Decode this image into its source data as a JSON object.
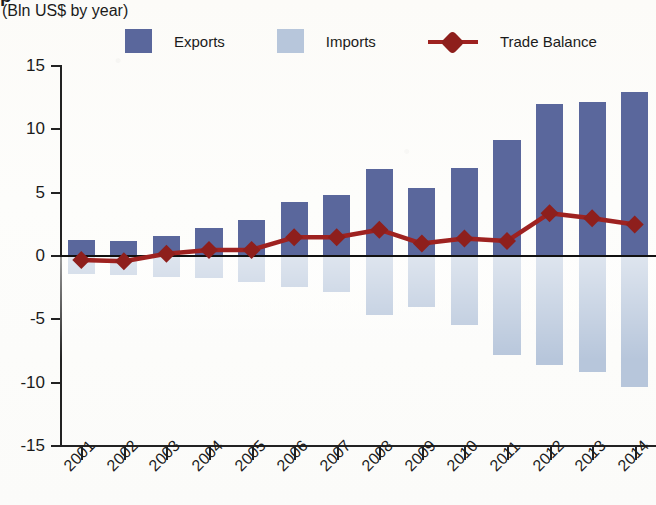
{
  "title_partial": "p",
  "subtitle": "(Bln US$ by year)",
  "legend": {
    "exports": {
      "label": "Exports",
      "color": "#5a679c"
    },
    "imports": {
      "label": "Imports",
      "color": "#b7c6db"
    },
    "balance": {
      "label": "Trade Balance",
      "color": "#9e2220"
    }
  },
  "axes": {
    "y_ticks": [
      "15",
      "10",
      "5",
      "0",
      "-5",
      "-10",
      "-15"
    ],
    "y_values": [
      15,
      10,
      5,
      0,
      -5,
      -10,
      -15
    ],
    "x_ticks": [
      "2001",
      "2002",
      "2003",
      "2004",
      "2005",
      "2006",
      "2007",
      "2008",
      "2009",
      "2010",
      "2011",
      "2012",
      "2013",
      "2014"
    ]
  },
  "chart_data": {
    "type": "bar",
    "title": "(Bln US$ by year)",
    "xlabel": "",
    "ylabel": "Bln US$",
    "ylim": [
      -15,
      15
    ],
    "grid": false,
    "legend_position": "top",
    "categories": [
      "2001",
      "2002",
      "2003",
      "2004",
      "2005",
      "2006",
      "2007",
      "2008",
      "2009",
      "2010",
      "2011",
      "2012",
      "2013",
      "2014"
    ],
    "series": [
      {
        "name": "Exports",
        "type": "bar",
        "color": "#5a679c",
        "values": [
          1.2,
          1.1,
          1.5,
          2.1,
          2.8,
          4.2,
          4.7,
          6.8,
          5.3,
          6.9,
          9.1,
          11.9,
          12.1,
          12.9
        ]
      },
      {
        "name": "Imports",
        "type": "bar",
        "color": "#b7c6db",
        "values": [
          -1.5,
          -1.6,
          -1.7,
          -1.8,
          -2.1,
          -2.5,
          -2.9,
          -4.7,
          -4.1,
          -5.5,
          -7.9,
          -8.7,
          -9.2,
          -10.4
        ]
      },
      {
        "name": "Trade Balance",
        "type": "line",
        "color": "#9e2220",
        "values": [
          -0.4,
          -0.5,
          0.1,
          0.4,
          0.4,
          1.4,
          1.4,
          2.0,
          0.9,
          1.3,
          1.1,
          3.3,
          2.9,
          2.4
        ]
      }
    ]
  }
}
